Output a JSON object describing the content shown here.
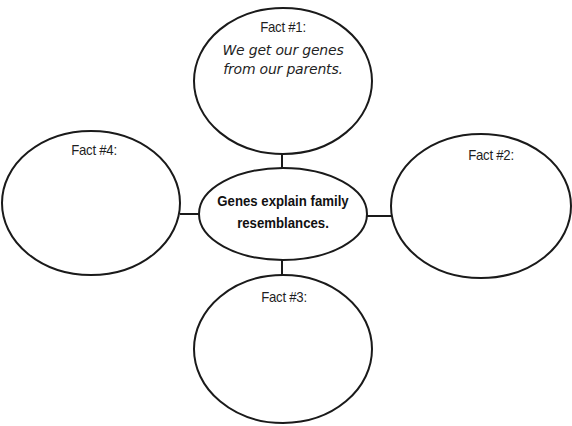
{
  "diagram": {
    "type": "concept-web",
    "stroke_color": "#1a1a1a",
    "background_color": "#ffffff",
    "center": {
      "text_line1": "Genes explain family",
      "text_line2": "resemblances."
    },
    "facts": [
      {
        "label": "Fact #1:",
        "position": "top",
        "answer_line1": "We get our genes",
        "answer_line2": "from our parents."
      },
      {
        "label": "Fact #2:",
        "position": "right",
        "answer_line1": "",
        "answer_line2": ""
      },
      {
        "label": "Fact #3:",
        "position": "bottom",
        "answer_line1": "",
        "answer_line2": ""
      },
      {
        "label": "Fact #4:",
        "position": "left",
        "answer_line1": "",
        "answer_line2": ""
      }
    ]
  }
}
